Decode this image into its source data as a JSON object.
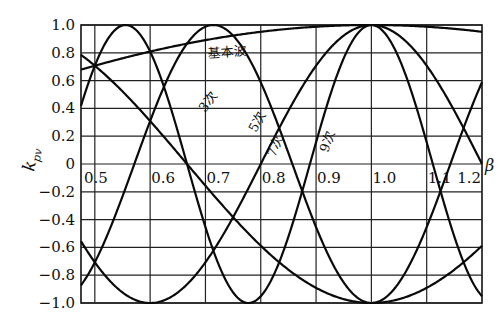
{
  "chart_data": {
    "type": "line",
    "title": "",
    "xlabel": "β",
    "ylabel": "k_pv",
    "xlim": [
      0.475,
      1.2
    ],
    "ylim": [
      -1.0,
      1.0
    ],
    "grid": true,
    "legend_position": "inline labels on curves",
    "x_ticks": [
      "0.5",
      "0.6",
      "0.7",
      "0.8",
      "0.9",
      "1.0",
      "1.1",
      "1.2"
    ],
    "y_ticks": [
      "1.0",
      "0.8",
      "0.6",
      "0.4",
      "0.2",
      "0",
      "-0.2",
      "-0.4",
      "-0.6",
      "-0.8",
      "-1.0"
    ],
    "formula": "k_pv = sin(v·β·90°)",
    "series": [
      {
        "name": "基本波",
        "harmonic": 1,
        "x": [
          0.475,
          0.6,
          0.7,
          0.8,
          0.9,
          1.0,
          1.1,
          1.2
        ],
        "values": [
          0.69,
          0.81,
          0.89,
          0.95,
          0.99,
          1.0,
          0.99,
          0.95
        ]
      },
      {
        "name": "3次",
        "harmonic": 3,
        "x": [
          0.475,
          0.55,
          0.6,
          0.7,
          0.8,
          0.9,
          1.0,
          1.1,
          1.2
        ],
        "values": [
          0.8,
          1.0,
          0.95,
          0.45,
          -0.31,
          -0.89,
          1.0,
          0.89,
          0.59
        ]
      },
      {
        "name": "5次",
        "harmonic": 5,
        "x": [
          0.475,
          0.6,
          0.7,
          0.8,
          0.9,
          1.0,
          1.1,
          1.2
        ],
        "values": [
          -0.69,
          -1.0,
          -0.71,
          0.0,
          0.71,
          1.0,
          0.71,
          0.0
        ]
      },
      {
        "name": "7次",
        "harmonic": 7,
        "x": [
          0.475,
          0.6,
          0.7,
          0.8,
          0.9,
          1.0,
          1.1,
          1.2
        ],
        "values": [
          0.16,
          -0.31,
          -0.99,
          -0.59,
          0.45,
          1.0,
          0.45,
          -0.59
        ]
      },
      {
        "name": "9次",
        "harmonic": 9,
        "x": [
          0.475,
          0.6,
          0.7,
          0.8,
          0.9,
          1.0,
          1.1,
          1.2
        ],
        "values": [
          0.97,
          0.59,
          -0.16,
          -0.95,
          0.16,
          1.0,
          0.16,
          -0.95
        ]
      }
    ]
  },
  "labels": {
    "y_axis": "k",
    "y_axis_sub": "pv",
    "x_axis": "β",
    "fundamental": "基本波",
    "h3": "3次",
    "h5": "5次",
    "h7": "7次",
    "h9": "9次"
  }
}
